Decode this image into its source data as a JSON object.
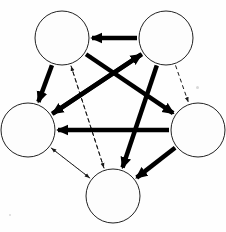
{
  "figure": {
    "title": "",
    "background_color": "#fefefe",
    "width": 226,
    "height": 232
  },
  "chart_data": {
    "type": "diagram",
    "diagram_kind": "directed-graph-complete-pentagon",
    "title": "",
    "xlabel": "",
    "ylabel": "",
    "node_count": 5,
    "node_radius": 27,
    "node_fill": "#fdfdfd",
    "node_stroke": "#222222",
    "node_stroke_width": 1,
    "nodes": [
      {
        "id": "n1",
        "label": "",
        "x": 62,
        "y": 38
      },
      {
        "id": "n2",
        "label": "",
        "x": 166,
        "y": 38
      },
      {
        "id": "n3",
        "label": "",
        "x": 28,
        "y": 130
      },
      {
        "id": "n4",
        "label": "",
        "x": 198,
        "y": 130
      },
      {
        "id": "n5",
        "label": "",
        "x": 113,
        "y": 196
      }
    ],
    "edge_styles": {
      "thin": {
        "color": "#1a1a1a",
        "width": 1,
        "dash": "4,3",
        "arrow": "small"
      },
      "thick": {
        "color": "#000000",
        "width": 4.5,
        "dash": "none",
        "arrow": "large"
      }
    },
    "edges_thin": [
      {
        "from": "n1",
        "to": "n3"
      },
      {
        "from": "n1",
        "to": "n4"
      },
      {
        "from": "n1",
        "to": "n5"
      },
      {
        "from": "n2",
        "to": "n1"
      },
      {
        "from": "n2",
        "to": "n3"
      },
      {
        "from": "n2",
        "to": "n4"
      },
      {
        "from": "n2",
        "to": "n5"
      },
      {
        "from": "n3",
        "to": "n4"
      },
      {
        "from": "n3",
        "to": "n5"
      },
      {
        "from": "n4",
        "to": "n5"
      },
      {
        "from": "n5",
        "to": "n1"
      },
      {
        "from": "n5",
        "to": "n3"
      },
      {
        "from": "n4",
        "to": "n1"
      },
      {
        "from": "n3",
        "to": "n2"
      }
    ],
    "edges_thick": [
      {
        "from": "n1",
        "to": "n3"
      },
      {
        "from": "n1",
        "to": "n4"
      },
      {
        "from": "n2",
        "to": "n1"
      },
      {
        "from": "n2",
        "to": "n3"
      },
      {
        "from": "n2",
        "to": "n5"
      },
      {
        "from": "n3",
        "to": "n2"
      },
      {
        "from": "n4",
        "to": "n3"
      },
      {
        "from": "n4",
        "to": "n5"
      }
    ],
    "legend": [],
    "annotations": [],
    "grid": false
  }
}
